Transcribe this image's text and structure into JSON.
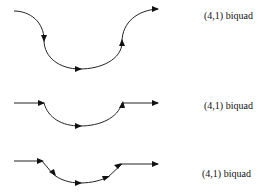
{
  "diagrams": [
    {
      "label": "(4,1) biquad",
      "type": "full-arc"
    },
    {
      "label": "(4,1) biquad",
      "type": "half-arc"
    },
    {
      "label": "(4,1) biquad",
      "type": "segmented-arc"
    }
  ]
}
